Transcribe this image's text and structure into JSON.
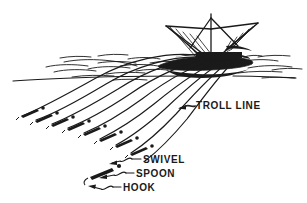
{
  "figure": {
    "type": "line-art-diagram",
    "background_color": "#ffffff",
    "ink_color": "#1a1a1a"
  },
  "labels": {
    "troll_line": "TROLL LINE",
    "swivel": "SWIVEL",
    "spoon": "SPOON",
    "hook": "HOOK"
  },
  "icons": {
    "boat": "boat-icon",
    "mast": "mast-icon",
    "outrigger": "outrigger-icon",
    "waterline": "waterline-icon",
    "wave": "wave-icon",
    "troll_line": "troll-line-icon",
    "lure": "lure-icon",
    "swivel": "swivel-icon",
    "hook": "hook-icon",
    "leader": "leader-arrow-icon"
  },
  "scene": {
    "waterline_y": 77,
    "boat": {
      "hull_x": 160,
      "hull_y": 62,
      "mast_top_y": 14,
      "mast_x": 211
    },
    "troll_lines_count": 9,
    "lures_count": 9
  }
}
